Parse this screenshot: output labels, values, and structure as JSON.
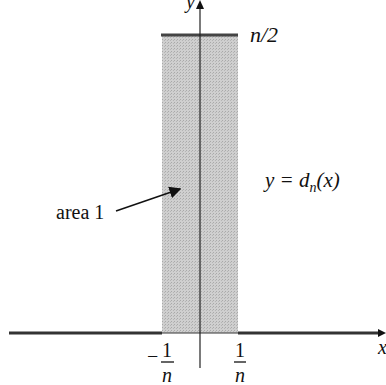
{
  "figure": {
    "type": "impulse-approximation-plot",
    "colors": {
      "axis": "#222222",
      "rect_fill": "#c8c8c8",
      "function_line": "#333333",
      "text": "#111111"
    },
    "axes": {
      "x_label": "x",
      "y_label": "y"
    },
    "rectangle": {
      "height_label": "n/2",
      "left_tick": {
        "sign": "−",
        "numerator": "1",
        "denominator": "n"
      },
      "right_tick": {
        "numerator": "1",
        "denominator": "n"
      }
    },
    "annotations": {
      "area_label": "area 1",
      "function_label_prefix": "y = d",
      "function_label_sub": "n",
      "function_label_suffix": "(x)"
    }
  }
}
